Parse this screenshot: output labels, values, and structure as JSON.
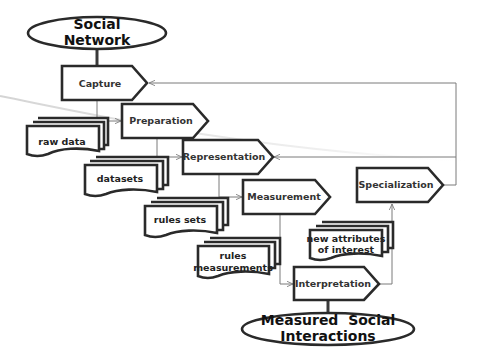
{
  "diagram": {
    "type": "process-flowchart",
    "terminals": [
      {
        "id": "social-network",
        "lines": [
          "Social",
          "Network"
        ]
      },
      {
        "id": "measured-social-interactions",
        "lines": [
          "Measured  Social",
          "Interactions"
        ]
      }
    ],
    "processes": [
      {
        "id": "capture",
        "label": "Capture"
      },
      {
        "id": "preparation",
        "label": "Preparation"
      },
      {
        "id": "representation",
        "label": "Representation"
      },
      {
        "id": "measurement",
        "label": "Measurement"
      },
      {
        "id": "interpretation",
        "label": "Interpretation"
      },
      {
        "id": "specialization",
        "label": "Specialization"
      }
    ],
    "documents": [
      {
        "id": "raw-data",
        "lines": [
          "raw data"
        ]
      },
      {
        "id": "datasets",
        "lines": [
          "datasets"
        ]
      },
      {
        "id": "rules-sets",
        "lines": [
          "rules sets"
        ]
      },
      {
        "id": "rules-measurements",
        "lines": [
          "rules",
          "measurements"
        ]
      },
      {
        "id": "new-attributes",
        "lines": [
          "new attributes",
          "of interest"
        ]
      }
    ],
    "edges": [
      {
        "from": "social-network",
        "to": "capture"
      },
      {
        "from": "capture",
        "to": "preparation"
      },
      {
        "from": "preparation",
        "to": "representation"
      },
      {
        "from": "representation",
        "to": "measurement"
      },
      {
        "from": "measurement",
        "to": "interpretation"
      },
      {
        "from": "interpretation",
        "to": "specialization"
      },
      {
        "from": "interpretation",
        "to": "measured-social-interactions"
      },
      {
        "from": "specialization",
        "to": "capture",
        "kind": "feedback"
      },
      {
        "from": "specialization",
        "to": "representation",
        "kind": "feedback"
      }
    ],
    "colors": {
      "stroke": "#2a2a2a",
      "connector": "#7a7a7a",
      "fill": "#ffffff"
    }
  }
}
